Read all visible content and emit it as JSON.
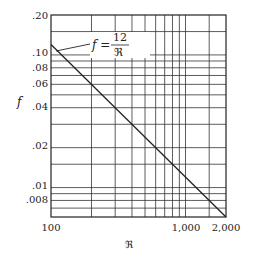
{
  "chart_data": {
    "type": "line",
    "title": "",
    "xlabel": "ℜ",
    "ylabel": "f",
    "xscale": "log",
    "yscale": "log",
    "xlim": [
      100,
      2000
    ],
    "ylim": [
      0.006,
      0.2
    ],
    "grid": true,
    "x_tick_labels": [
      "100",
      "1,000",
      "2,000"
    ],
    "y_tick_labels": [
      ".20",
      ".10",
      ".08",
      ".06",
      ".04",
      ".02",
      ".01",
      ".008"
    ],
    "series": [
      {
        "name": "f = 12/ℜ",
        "x": [
          100,
          2000
        ],
        "y": [
          0.12,
          0.006
        ]
      }
    ],
    "annotations": [
      {
        "text_lhs": "f =",
        "numerator": "12",
        "denominator": "ℜ",
        "points_to": [
          100,
          0.12
        ]
      }
    ]
  },
  "labels": {
    "ylabel": "f",
    "xlabel": "ℜ",
    "ann_lhs": "f =",
    "ann_num": "12",
    "ann_den": "ℜ",
    "yt_020": ".20",
    "yt_010": ".10",
    "yt_008": ".08",
    "yt_006": ".06",
    "yt_004": ".04",
    "yt_002": ".02",
    "yt_001": ".01",
    "yt_0008": ".008",
    "xt_100": "100",
    "xt_1000": "1,000",
    "xt_2000": "2,000"
  },
  "colors": {
    "line": "#222222",
    "grid": "#333333",
    "background": "#ffffff"
  }
}
